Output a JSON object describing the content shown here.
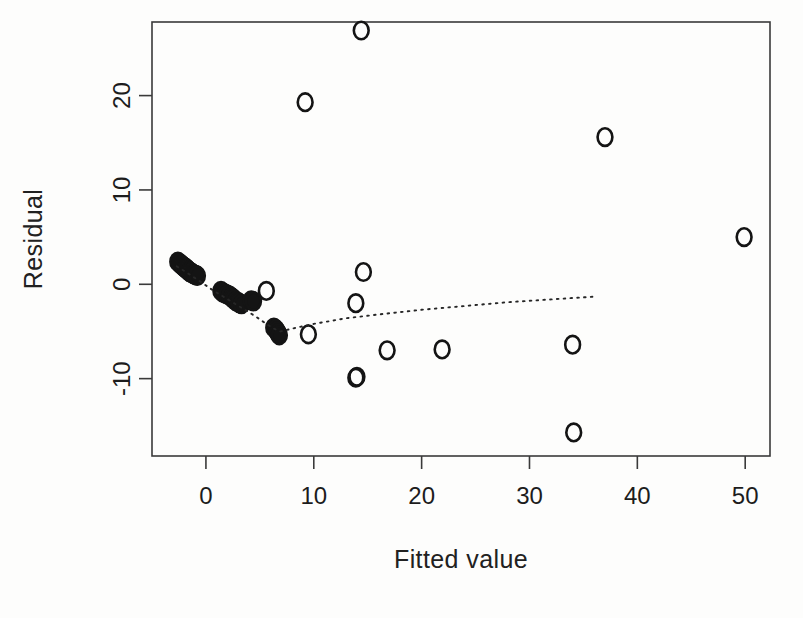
{
  "figure": {
    "kind": "residual-plot",
    "background_color": "#fdfdfc",
    "ink_color": "#141414"
  },
  "chart_data": {
    "type": "scatter",
    "title": "",
    "subtitle": "",
    "xlabel": "Fitted value",
    "ylabel": "Residual",
    "xlim": [
      -5.0,
      52.3
    ],
    "ylim": [
      -18.2,
      27.8
    ],
    "xticks": [
      0,
      10,
      20,
      30,
      40,
      50
    ],
    "xticklabels": [
      "0",
      "10",
      "20",
      "30",
      "40",
      "50"
    ],
    "yticks": [
      -10,
      0,
      10,
      20
    ],
    "yticklabels": [
      "-10",
      "0",
      "10",
      "20"
    ],
    "grid": false,
    "legend": null,
    "marker": "open-circle",
    "series": [
      {
        "name": "residuals",
        "x": [
          -2.6,
          -2.4,
          -2.3,
          -2.2,
          -2.1,
          -2.0,
          -1.9,
          -1.85,
          -1.8,
          -1.7,
          -1.6,
          -1.55,
          -1.5,
          -1.4,
          -1.3,
          -1.2,
          -1.1,
          -1.0,
          -0.9,
          -0.8,
          1.4,
          1.6,
          1.8,
          2.0,
          2.2,
          2.4,
          2.5,
          2.6,
          2.8,
          3.0,
          3.1,
          3.3,
          4.2,
          4.4,
          5.6,
          6.3,
          6.5,
          6.6,
          6.7,
          6.8,
          9.2,
          9.5,
          14.4,
          14.6,
          13.9,
          14.0,
          13.9,
          16.8,
          21.9,
          34.0,
          34.1,
          37.0,
          49.9
        ],
        "y": [
          2.4,
          2.2,
          2.1,
          2.0,
          1.9,
          1.8,
          1.75,
          1.7,
          1.6,
          1.5,
          1.45,
          1.4,
          1.3,
          1.25,
          1.2,
          1.1,
          1.05,
          1.0,
          0.95,
          0.9,
          -0.7,
          -0.9,
          -1.0,
          -1.1,
          -1.2,
          -1.4,
          -1.5,
          -1.6,
          -1.8,
          -1.9,
          -2.0,
          -2.1,
          -1.7,
          -1.8,
          -0.7,
          -4.6,
          -4.8,
          -5.0,
          -5.2,
          -5.4,
          19.3,
          -5.3,
          26.9,
          1.3,
          -2.0,
          -9.8,
          -9.9,
          -7.0,
          -6.9,
          -6.4,
          -15.7,
          15.6,
          5.0
        ]
      }
    ],
    "smoother": {
      "name": "lowess",
      "style": "dotted",
      "x": [
        -2.7,
        -2.0,
        -1.2,
        -0.4,
        0.6,
        1.6,
        2.6,
        3.6,
        4.6,
        5.6,
        6.3,
        6.9,
        8.0,
        10.0,
        13.0,
        16.0,
        20.0,
        24.0,
        28.0,
        32.0,
        36.2
      ],
      "y": [
        1.9,
        1.4,
        0.8,
        0.2,
        -0.6,
        -1.3,
        -2.0,
        -2.7,
        -3.4,
        -4.2,
        -4.7,
        -5.0,
        -4.7,
        -4.2,
        -3.6,
        -3.2,
        -2.7,
        -2.3,
        -1.9,
        -1.6,
        -1.3
      ]
    }
  },
  "labels": {
    "x_axis_title": "Fitted value",
    "y_axis_title": "Residual"
  }
}
